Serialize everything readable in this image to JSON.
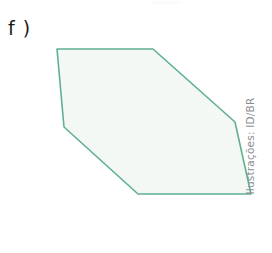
{
  "figure": {
    "item_label": "f )",
    "credit": "Ilustrações: ID/BR",
    "background_color": "#ffffff",
    "shape": {
      "name": "hexagon",
      "stroke_color": "#5fb093",
      "fill_color": "#f3f8f5",
      "stroke_width": 1.6,
      "vertices": [
        {
          "x": 57,
          "y": 49
        },
        {
          "x": 153,
          "y": 49
        },
        {
          "x": 235,
          "y": 122
        },
        {
          "x": 251,
          "y": 194
        },
        {
          "x": 138,
          "y": 194
        },
        {
          "x": 64,
          "y": 127
        }
      ],
      "points_attr": "57,49 153,49 235,122 251,194 138,194 64,127"
    }
  }
}
